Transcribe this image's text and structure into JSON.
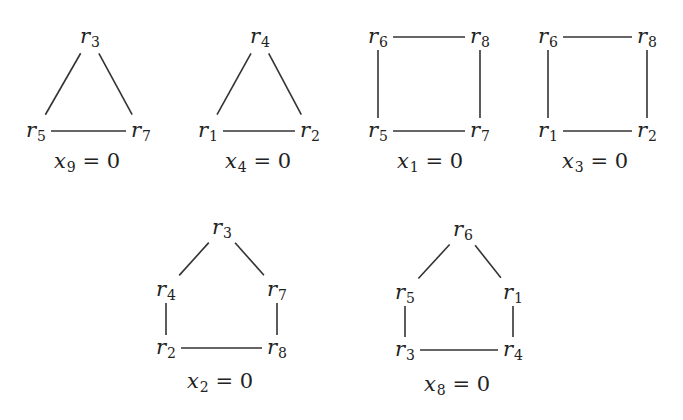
{
  "graphs": [
    {
      "caption": {
        "var": "x",
        "sub": "9",
        "rest": " = 0"
      },
      "shape": "triangle",
      "nodes": [
        {
          "id": "r3",
          "sym": "r",
          "sub": "3",
          "x": 90,
          "y": 37
        },
        {
          "id": "r5",
          "sym": "r",
          "sub": "5",
          "x": 36,
          "y": 131
        },
        {
          "id": "r7",
          "sym": "r",
          "sub": "7",
          "x": 141,
          "y": 131
        }
      ],
      "edges": [
        [
          "r3",
          "r5"
        ],
        [
          "r3",
          "r7"
        ],
        [
          "r5",
          "r7"
        ]
      ]
    },
    {
      "caption": {
        "var": "x",
        "sub": "4",
        "rest": " = 0"
      },
      "shape": "triangle",
      "nodes": [
        {
          "id": "r4",
          "sym": "r",
          "sub": "4",
          "x": 260,
          "y": 37
        },
        {
          "id": "r1",
          "sym": "r",
          "sub": "1",
          "x": 208,
          "y": 131
        },
        {
          "id": "r2",
          "sym": "r",
          "sub": "2",
          "x": 310,
          "y": 131
        }
      ],
      "edges": [
        [
          "r4",
          "r1"
        ],
        [
          "r4",
          "r2"
        ],
        [
          "r1",
          "r2"
        ]
      ]
    },
    {
      "caption": {
        "var": "x",
        "sub": "1",
        "rest": " = 0"
      },
      "shape": "square",
      "nodes": [
        {
          "id": "r6",
          "sym": "r",
          "sub": "6",
          "x": 378,
          "y": 37
        },
        {
          "id": "r8",
          "sym": "r",
          "sub": "8",
          "x": 480,
          "y": 37
        },
        {
          "id": "r5",
          "sym": "r",
          "sub": "5",
          "x": 378,
          "y": 131
        },
        {
          "id": "r7",
          "sym": "r",
          "sub": "7",
          "x": 480,
          "y": 131
        }
      ],
      "edges": [
        [
          "r6",
          "r8"
        ],
        [
          "r6",
          "r5"
        ],
        [
          "r8",
          "r7"
        ],
        [
          "r5",
          "r7"
        ]
      ]
    },
    {
      "caption": {
        "var": "x",
        "sub": "3",
        "rest": " = 0"
      },
      "shape": "square",
      "nodes": [
        {
          "id": "r6",
          "sym": "r",
          "sub": "6",
          "x": 548,
          "y": 37
        },
        {
          "id": "r8",
          "sym": "r",
          "sub": "8",
          "x": 647,
          "y": 37
        },
        {
          "id": "r1",
          "sym": "r",
          "sub": "1",
          "x": 548,
          "y": 131
        },
        {
          "id": "r2",
          "sym": "r",
          "sub": "2",
          "x": 647,
          "y": 131
        }
      ],
      "edges": [
        [
          "r6",
          "r8"
        ],
        [
          "r6",
          "r1"
        ],
        [
          "r8",
          "r2"
        ],
        [
          "r1",
          "r2"
        ]
      ]
    },
    {
      "caption": {
        "var": "x",
        "sub": "2",
        "rest": " = 0"
      },
      "shape": "pentagon",
      "nodes": [
        {
          "id": "r3",
          "sym": "r",
          "sub": "3",
          "x": 222,
          "y": 228
        },
        {
          "id": "r4",
          "sym": "r",
          "sub": "4",
          "x": 166,
          "y": 290
        },
        {
          "id": "r7",
          "sym": "r",
          "sub": "7",
          "x": 277,
          "y": 290
        },
        {
          "id": "r2",
          "sym": "r",
          "sub": "2",
          "x": 166,
          "y": 348
        },
        {
          "id": "r8",
          "sym": "r",
          "sub": "8",
          "x": 277,
          "y": 348
        }
      ],
      "edges": [
        [
          "r3",
          "r4"
        ],
        [
          "r3",
          "r7"
        ],
        [
          "r4",
          "r2"
        ],
        [
          "r7",
          "r8"
        ],
        [
          "r2",
          "r8"
        ]
      ]
    },
    {
      "caption": {
        "var": "x",
        "sub": "8",
        "rest": " = 0"
      },
      "shape": "pentagon",
      "nodes": [
        {
          "id": "r6",
          "sym": "r",
          "sub": "6",
          "x": 463,
          "y": 230
        },
        {
          "id": "r5",
          "sym": "r",
          "sub": "5",
          "x": 405,
          "y": 293
        },
        {
          "id": "r1",
          "sym": "r",
          "sub": "1",
          "x": 513,
          "y": 293
        },
        {
          "id": "r3",
          "sym": "r",
          "sub": "3",
          "x": 405,
          "y": 350
        },
        {
          "id": "r4",
          "sym": "r",
          "sub": "4",
          "x": 513,
          "y": 350
        }
      ],
      "edges": [
        [
          "r6",
          "r5"
        ],
        [
          "r6",
          "r1"
        ],
        [
          "r5",
          "r3"
        ],
        [
          "r1",
          "r4"
        ],
        [
          "r3",
          "r4"
        ]
      ]
    }
  ],
  "caption_positions": [
    {
      "x": 87,
      "y": 162
    },
    {
      "x": 258,
      "y": 162
    },
    {
      "x": 430,
      "y": 162
    },
    {
      "x": 595,
      "y": 162
    },
    {
      "x": 220,
      "y": 382
    },
    {
      "x": 457,
      "y": 385
    }
  ]
}
